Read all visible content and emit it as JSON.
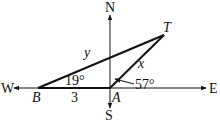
{
  "diagram": {
    "type": "navigation-triangle",
    "compass": {
      "north": "N",
      "south": "S",
      "east": "E",
      "west": "W"
    },
    "points": {
      "B": {
        "label": "B"
      },
      "A": {
        "label": "A"
      },
      "T": {
        "label": "T"
      }
    },
    "sides": {
      "BA": {
        "label": "3"
      },
      "AT": {
        "label": "x"
      },
      "BT": {
        "label": "y"
      }
    },
    "angles": {
      "at_B": {
        "label": "19°"
      },
      "at_A": {
        "label": "57°"
      }
    },
    "colors": {
      "line": "#111111",
      "background": "#ffffff"
    }
  }
}
